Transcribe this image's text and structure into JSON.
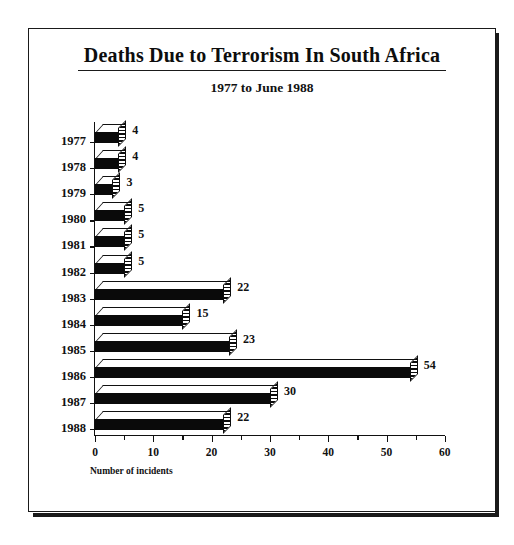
{
  "chart_data": {
    "type": "bar",
    "orientation": "horizontal",
    "title": "Deaths Due to Terrorism In South Africa",
    "subtitle": "1977 to June 1988",
    "xlabel": "Number of incidents",
    "ylabel": "",
    "xlim": [
      0,
      60
    ],
    "xticks": [
      0,
      10,
      20,
      30,
      40,
      50,
      60
    ],
    "xtick_labels": [
      "0",
      "10",
      "20",
      "30",
      "40",
      "50",
      "60"
    ],
    "minor_tick_step": 5,
    "grid": false,
    "legend": false,
    "categories": [
      "1977",
      "1978",
      "1979",
      "1980",
      "1981",
      "1982",
      "1983",
      "1984",
      "1985",
      "1986",
      "1987",
      "1988"
    ],
    "values": [
      4,
      4,
      3,
      5,
      5,
      5,
      22,
      15,
      23,
      54,
      30,
      22
    ],
    "value_labels": [
      "4",
      "4",
      "3",
      "5",
      "5",
      "5",
      "22",
      "15",
      "23",
      "54",
      "30",
      "22"
    ],
    "style": {
      "bar_front_color": "#0a0a0a",
      "bar_top_color": "#ffffff",
      "bar_side_pattern": "hatched",
      "axis_color": "#111111",
      "background": "#ffffff",
      "frame_color": "#1a1a1a"
    }
  }
}
